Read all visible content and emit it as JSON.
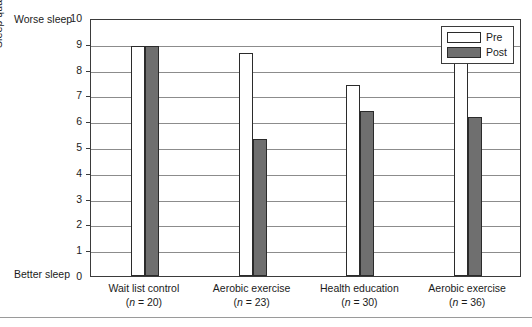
{
  "chart_data": {
    "type": "bar",
    "title": "",
    "xlabel": "",
    "ylabel": "Sleep quality (Pittsburg Sleep Quality Index)",
    "ylim": [
      0,
      10
    ],
    "ytick_labels": [
      "10",
      "9",
      "8",
      "7",
      "6",
      "5",
      "4",
      "3",
      "2",
      "1",
      "0"
    ],
    "yticks": [
      10,
      9,
      8,
      7,
      6,
      5,
      4,
      3,
      2,
      1,
      0
    ],
    "grid": true,
    "legend_position": "top-right",
    "axis_annotations": {
      "y_top": "Worse sleep",
      "y_bottom": "Better sleep"
    },
    "categories": [
      "Wait list control",
      "Aerobic exercise",
      "Health education",
      "Aerobic exercise"
    ],
    "category_sample_sizes": [
      "(n = 20)",
      "(n = 23)",
      "(n = 30)",
      "(n = 36)"
    ],
    "category_n_values": [
      20,
      23,
      30,
      36
    ],
    "series": [
      {
        "name": "Pre",
        "color": "#ffffff",
        "values": [
          8.9,
          8.65,
          7.4,
          8.3
        ]
      },
      {
        "name": "Post",
        "color": "#6f6f6f",
        "values": [
          8.9,
          5.3,
          6.4,
          6.15
        ]
      }
    ]
  },
  "legend": {
    "entries": [
      {
        "label": "Pre"
      },
      {
        "label": "Post"
      }
    ]
  }
}
